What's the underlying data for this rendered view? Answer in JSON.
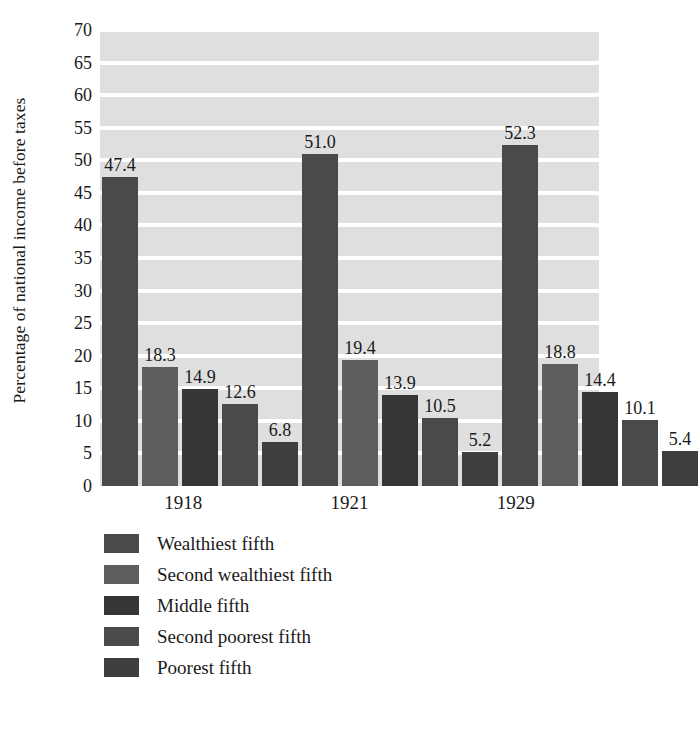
{
  "chart_data": {
    "type": "bar",
    "title": "",
    "xlabel": "",
    "ylabel": "Percentage of national income before taxes",
    "categories": [
      "1918",
      "1921",
      "1929"
    ],
    "ylim": [
      0,
      70
    ],
    "ytick_step": 5,
    "yticks": [
      "70",
      "65",
      "60",
      "55",
      "50",
      "45",
      "40",
      "35",
      "30",
      "25",
      "20",
      "15",
      "10",
      "5",
      "0"
    ],
    "grid": true,
    "legend_position": "bottom-left",
    "series": [
      {
        "name": "Wealthiest fifth",
        "color": "#4a4a4a",
        "values": [
          47.4,
          51.0,
          52.3
        ],
        "labels": [
          "47.4",
          "51.0",
          "52.3"
        ]
      },
      {
        "name": "Second wealthiest fifth",
        "color": "#5e5e5e",
        "values": [
          18.3,
          19.4,
          18.8
        ],
        "labels": [
          "18.3",
          "19.4",
          "18.8"
        ]
      },
      {
        "name": "Middle fifth",
        "color": "#363636",
        "values": [
          14.9,
          13.9,
          14.4
        ],
        "labels": [
          "14.9",
          "13.9",
          "14.4"
        ]
      },
      {
        "name": "Second poorest fifth",
        "color": "#4a4a4a",
        "values": [
          12.6,
          10.5,
          10.1
        ],
        "labels": [
          "12.6",
          "10.5",
          "10.1"
        ]
      },
      {
        "name": "Poorest fifth",
        "color": "#3f3f3f",
        "values": [
          6.8,
          5.2,
          5.4
        ],
        "labels": [
          "6.8",
          "5.2",
          "5.4"
        ]
      }
    ],
    "plot_background": "#dfdfdf",
    "gridline_color": "#ffffff"
  }
}
